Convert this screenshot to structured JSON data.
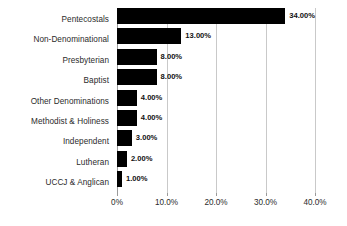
{
  "chart_data": {
    "type": "bar",
    "orientation": "horizontal",
    "title": "",
    "subtitle": "",
    "xlabel": "",
    "ylabel": "",
    "categories": [
      "Pentecostals",
      "Non-Denominational",
      "Presbyterian",
      "Baptist",
      "Other Denominations",
      "Methodist & Holiness",
      "Independent",
      "Lutheran",
      "UCCJ & Anglican"
    ],
    "values": [
      34,
      13,
      8,
      8,
      4,
      4,
      3,
      2,
      1
    ],
    "value_labels": [
      "34.00%",
      "13.00%",
      "8.00%",
      "8.00%",
      "4.00%",
      "4.00%",
      "3.00%",
      "2.00%",
      "1.00%"
    ],
    "xlim": [
      0,
      40
    ],
    "xticks": [
      0,
      10,
      20,
      30,
      40
    ],
    "xtick_labels": [
      "0%",
      "10.0%",
      "20.0%",
      "30.0%",
      "40.0%"
    ],
    "grid": "vertical",
    "legend": "none",
    "bar_color": "#000000",
    "grid_color": "#c9c9c9",
    "background_color": "#ffffff",
    "label_color": "#2b2b2b"
  }
}
